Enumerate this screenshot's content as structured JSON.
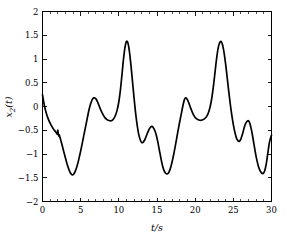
{
  "chart_data": {
    "type": "line",
    "title": "",
    "subtitle": "",
    "xlabel": "t/s",
    "ylabel": "x_2(t)",
    "ylabel_base": "x",
    "ylabel_sub": "2",
    "ylabel_tail": "(t)",
    "xlim": [
      0,
      30
    ],
    "ylim": [
      -2,
      2
    ],
    "grid": false,
    "legend": null,
    "line_color": "#000000",
    "axis_color": "#000000",
    "background_color": "#ffffff",
    "xticks": [
      0,
      5,
      10,
      15,
      20,
      25,
      30
    ],
    "xtick_labels": [
      "0",
      "5",
      "10",
      "15",
      "20",
      "25",
      "30"
    ],
    "yticks": [
      -2,
      -1.5,
      -1,
      -0.5,
      0,
      0.5,
      1,
      1.5,
      2
    ],
    "ytick_labels": [
      "−2",
      "−1.5",
      "−1",
      "−0.5",
      "0",
      "0.5",
      "1",
      "1.5",
      "2"
    ],
    "series": [
      {
        "name": "x2(t)",
        "x": [
          0.0,
          0.15,
          0.3,
          0.5,
          0.7,
          0.9,
          1.1,
          1.3,
          1.5,
          1.7,
          1.85,
          1.95,
          2.0,
          2.05,
          2.12,
          2.2,
          2.3,
          2.45,
          2.6,
          2.8,
          3.0,
          3.2,
          3.4,
          3.6,
          3.8,
          3.95,
          4.1,
          4.3,
          4.5,
          4.7,
          4.9,
          5.1,
          5.3,
          5.5,
          5.7,
          5.9,
          6.05,
          6.2,
          6.4,
          6.6,
          6.8,
          7.0,
          7.2,
          7.4,
          7.6,
          7.8,
          8.0,
          8.2,
          8.4,
          8.6,
          8.8,
          9.0,
          9.2,
          9.4,
          9.6,
          9.8,
          10.0,
          10.2,
          10.4,
          10.6,
          10.8,
          11.0,
          11.2,
          11.4,
          11.6,
          11.8,
          12.0,
          12.2,
          12.4,
          12.6,
          12.8,
          13.0,
          13.2,
          13.4,
          13.6,
          13.8,
          14.0,
          14.2,
          14.35,
          14.5,
          14.7,
          14.9,
          15.1,
          15.3,
          15.5,
          15.7,
          15.9,
          16.1,
          16.3,
          16.45,
          16.6,
          16.8,
          17.0,
          17.2,
          17.4,
          17.6,
          17.8,
          18.0,
          18.2,
          18.4,
          18.6,
          18.8,
          19.0,
          19.2,
          19.4,
          19.6,
          19.8,
          20.0,
          20.2,
          20.4,
          20.6,
          20.8,
          21.0,
          21.2,
          21.4,
          21.6,
          21.8,
          22.0,
          22.2,
          22.4,
          22.6,
          22.8,
          23.0,
          23.2,
          23.4,
          23.6,
          23.8,
          24.0,
          24.2,
          24.4,
          24.6,
          24.8,
          25.0,
          25.2,
          25.4,
          25.6,
          25.8,
          26.0,
          26.2,
          26.4,
          26.6,
          26.9,
          27.1,
          27.3,
          27.5,
          27.7,
          27.9,
          28.1,
          28.3,
          28.5,
          28.7,
          28.9,
          29.1,
          29.3,
          29.5,
          29.7,
          29.85,
          30.0
        ],
        "y": [
          0.25,
          0.1,
          -0.02,
          -0.14,
          -0.24,
          -0.32,
          -0.38,
          -0.44,
          -0.49,
          -0.53,
          -0.56,
          -0.58,
          -0.5,
          -0.55,
          -0.62,
          -0.6,
          -0.66,
          -0.74,
          -0.83,
          -0.96,
          -1.08,
          -1.2,
          -1.3,
          -1.38,
          -1.43,
          -1.44,
          -1.42,
          -1.36,
          -1.27,
          -1.15,
          -1.01,
          -0.86,
          -0.7,
          -0.54,
          -0.38,
          -0.22,
          -0.1,
          0.0,
          0.1,
          0.17,
          0.18,
          0.16,
          0.1,
          0.02,
          -0.06,
          -0.13,
          -0.19,
          -0.24,
          -0.27,
          -0.29,
          -0.3,
          -0.3,
          -0.28,
          -0.24,
          -0.17,
          -0.06,
          0.1,
          0.34,
          0.65,
          0.98,
          1.24,
          1.37,
          1.33,
          1.14,
          0.85,
          0.51,
          0.17,
          -0.14,
          -0.39,
          -0.58,
          -0.7,
          -0.76,
          -0.75,
          -0.7,
          -0.62,
          -0.54,
          -0.47,
          -0.43,
          -0.42,
          -0.44,
          -0.5,
          -0.6,
          -0.74,
          -0.91,
          -1.08,
          -1.23,
          -1.34,
          -1.4,
          -1.42,
          -1.41,
          -1.37,
          -1.28,
          -1.15,
          -1.0,
          -0.83,
          -0.65,
          -0.47,
          -0.3,
          -0.14,
          0.02,
          0.15,
          0.18,
          0.14,
          0.06,
          -0.03,
          -0.11,
          -0.18,
          -0.23,
          -0.26,
          -0.28,
          -0.29,
          -0.29,
          -0.28,
          -0.26,
          -0.23,
          -0.18,
          -0.1,
          0.02,
          0.2,
          0.44,
          0.72,
          1.0,
          1.22,
          1.34,
          1.37,
          1.29,
          1.12,
          0.88,
          0.6,
          0.32,
          0.05,
          -0.18,
          -0.38,
          -0.54,
          -0.66,
          -0.72,
          -0.73,
          -0.68,
          -0.58,
          -0.46,
          -0.36,
          -0.3,
          -0.33,
          -0.44,
          -0.6,
          -0.79,
          -0.98,
          -1.14,
          -1.27,
          -1.35,
          -1.4,
          -1.41,
          -1.36,
          -1.22,
          -1.0,
          -0.78,
          -0.68,
          -0.6
        ]
      }
    ],
    "annotations": []
  },
  "axis_titles": {
    "x": "t/s",
    "y_base": "x",
    "y_sub": "2",
    "y_tail": "(t)"
  }
}
